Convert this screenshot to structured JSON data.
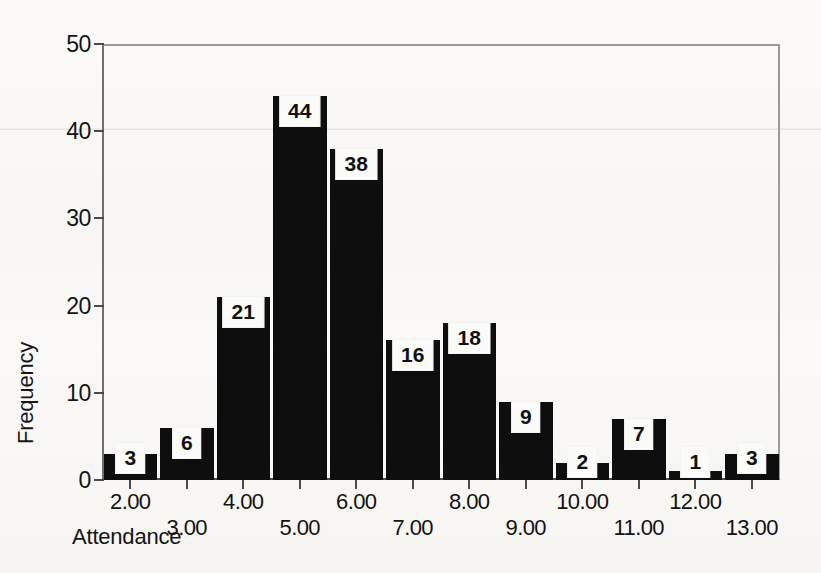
{
  "chart_data": {
    "type": "bar",
    "title": "",
    "subtitle": "",
    "xlabel": "Attendance",
    "ylabel": "Frequency",
    "categories": [
      "2.00",
      "3.00",
      "4.00",
      "5.00",
      "6.00",
      "7.00",
      "8.00",
      "9.00",
      "10.00",
      "11.00",
      "12.00",
      "13.00"
    ],
    "values": [
      3,
      6,
      21,
      44,
      38,
      16,
      18,
      9,
      2,
      7,
      1,
      3
    ],
    "data_labels": [
      "3",
      "6",
      "21",
      "44",
      "38",
      "16",
      "18",
      "9",
      "2",
      "7",
      "1",
      "3"
    ],
    "ylim": [
      0,
      50
    ],
    "y_ticks": [
      "0",
      "10",
      "20",
      "30",
      "40",
      "50"
    ],
    "y_tick_values": [
      0,
      10,
      20,
      30,
      40,
      50
    ],
    "x_tick_labels": [
      "2.00",
      "3.00",
      "4.00",
      "5.00",
      "6.00",
      "7.00",
      "8.00",
      "9.00",
      "10.00",
      "11.00",
      "12.00",
      "13.00"
    ],
    "grid": false,
    "legend": null,
    "bar_color": "#0e0e0e",
    "label_box_color": "#fbfbf9",
    "label_text_color": "#111111",
    "axis_color": "#4a4a4a",
    "background_color": "#faf9f7"
  }
}
